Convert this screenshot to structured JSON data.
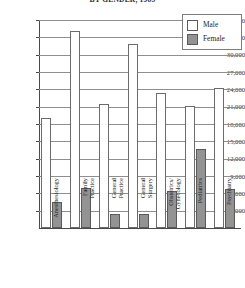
{
  "chart_data": {
    "type": "bar",
    "title": "BY GENDER, 1985",
    "xlabel": "",
    "ylabel": "",
    "ylim": [
      0,
      36000
    ],
    "ytick_step": 3000,
    "grid": true,
    "legend_position": "top-right",
    "categories": [
      "Anesthesiology",
      "Family Practice",
      "General Practice",
      "General Surgery",
      "Obstetrics/Gynecology",
      "Pediatrics",
      "Psychiatry"
    ],
    "category_lines": [
      [
        "Anesthesiology",
        ""
      ],
      [
        "Family",
        "Practice"
      ],
      [
        "General",
        "Practice"
      ],
      [
        "General",
        "Surgery"
      ],
      [
        "Obstetrics/",
        "Gynecology"
      ],
      [
        "Pediatrics",
        ""
      ],
      [
        "Psychiatry",
        ""
      ]
    ],
    "ticks": [
      "36,000",
      "33,000",
      "30,000",
      "27,000",
      "24,000",
      "21,000",
      "18,000",
      "15,000",
      "12,000",
      "9,000",
      "6,000",
      "3,000"
    ],
    "tick_values": [
      36000,
      33000,
      30000,
      27000,
      24000,
      21000,
      18000,
      15000,
      12000,
      9000,
      6000,
      3000
    ],
    "series": [
      {
        "name": "Male",
        "color": "#ffffff",
        "values": [
          19000,
          34100,
          21500,
          31800,
          23400,
          21100,
          24200
        ]
      },
      {
        "name": "Female",
        "color": "#939393",
        "values": [
          4500,
          7000,
          2500,
          2400,
          6400,
          13600,
          6800
        ]
      }
    ]
  },
  "legend": {
    "items": [
      {
        "label": "Male",
        "swatch": "male"
      },
      {
        "label": "Female",
        "swatch": "female"
      }
    ]
  }
}
